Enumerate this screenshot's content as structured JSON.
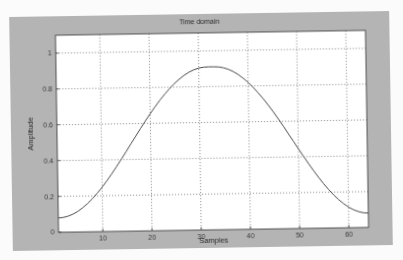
{
  "figure": {
    "title": "Time domain",
    "xlabel": "Samples",
    "ylabel": "Amplitude",
    "background_color": "#b4b4b4",
    "axes_color": "#ffffff",
    "line_color": "#4a4a4a",
    "grid_color": "#555555"
  },
  "chart_data": {
    "type": "line",
    "title": "Time domain",
    "xlabel": "Samples",
    "ylabel": "Amplitude",
    "xlim": [
      1,
      64
    ],
    "ylim": [
      0,
      1.1
    ],
    "xticks": [
      10,
      20,
      30,
      40,
      50,
      60
    ],
    "xtick_labels": [
      "10",
      "20",
      "30",
      "40",
      "50",
      "60"
    ],
    "yticks": [
      0,
      0.2,
      0.4,
      0.6,
      0.8,
      1
    ],
    "ytick_labels": [
      "0",
      "0.2",
      "0.4",
      "0.6",
      "0.8",
      "1"
    ],
    "grid": true,
    "legend": null,
    "series": [
      {
        "name": "Hamming window (64 samples)",
        "x": [
          1,
          2,
          3,
          4,
          5,
          6,
          7,
          8,
          9,
          10,
          11,
          12,
          13,
          14,
          15,
          16,
          17,
          18,
          19,
          20,
          21,
          22,
          23,
          24,
          25,
          26,
          27,
          28,
          29,
          30,
          31,
          32,
          33,
          34,
          35,
          36,
          37,
          38,
          39,
          40,
          41,
          42,
          43,
          44,
          45,
          46,
          47,
          48,
          49,
          50,
          51,
          52,
          53,
          54,
          55,
          56,
          57,
          58,
          59,
          60,
          61,
          62,
          63,
          64
        ],
        "values": [
          0.08,
          0.082,
          0.089,
          0.1,
          0.115,
          0.135,
          0.158,
          0.185,
          0.215,
          0.248,
          0.284,
          0.322,
          0.362,
          0.403,
          0.445,
          0.488,
          0.53,
          0.573,
          0.614,
          0.654,
          0.692,
          0.728,
          0.761,
          0.792,
          0.82,
          0.844,
          0.865,
          0.882,
          0.895,
          0.904,
          0.909,
          0.91,
          0.91,
          0.909,
          0.904,
          0.895,
          0.882,
          0.865,
          0.844,
          0.82,
          0.792,
          0.761,
          0.728,
          0.692,
          0.654,
          0.614,
          0.573,
          0.53,
          0.488,
          0.445,
          0.403,
          0.362,
          0.322,
          0.284,
          0.248,
          0.215,
          0.185,
          0.158,
          0.135,
          0.115,
          0.1,
          0.089,
          0.082,
          0.08
        ]
      }
    ]
  }
}
